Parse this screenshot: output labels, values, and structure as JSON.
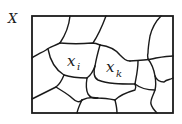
{
  "diagram": {
    "set_label": "X",
    "cells": [
      {
        "id": "xi",
        "label": "x",
        "subscript": "i"
      },
      {
        "id": "xk",
        "label": "x",
        "subscript": "k"
      }
    ],
    "colors": {
      "stroke": "#1a1a1a",
      "background": "#ffffff"
    }
  }
}
